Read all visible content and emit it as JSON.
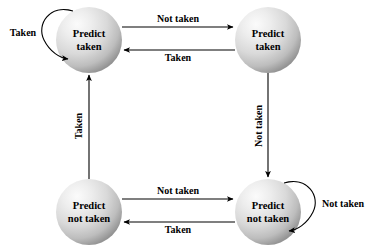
{
  "diagram": {
    "states": [
      {
        "id": "predict-taken-strong",
        "line1": "Predict",
        "line2": "taken",
        "cx": 89,
        "cy": 40,
        "r": 33
      },
      {
        "id": "predict-taken-weak",
        "line1": "Predict",
        "line2": "taken",
        "cx": 268,
        "cy": 40,
        "r": 33
      },
      {
        "id": "predict-not-taken-weak",
        "line1": "Predict",
        "line2": "not taken",
        "cx": 89,
        "cy": 212,
        "r": 33
      },
      {
        "id": "predict-not-taken-strong",
        "line1": "Predict",
        "line2": "not taken",
        "cx": 268,
        "cy": 212,
        "r": 33
      }
    ],
    "transitions": [
      {
        "id": "top-right-edge",
        "label": "Not taken",
        "from": "predict-taken-strong",
        "to": "predict-taken-weak",
        "label_x": 178,
        "label_y": 20
      },
      {
        "id": "top-left-edge",
        "label": "Taken",
        "from": "predict-taken-weak",
        "to": "predict-taken-strong",
        "label_x": 178,
        "label_y": 58
      },
      {
        "id": "bottom-right-edge",
        "label": "Not taken",
        "from": "predict-not-taken-weak",
        "to": "predict-not-taken-strong",
        "label_x": 178,
        "label_y": 192
      },
      {
        "id": "bottom-left-edge",
        "label": "Taken",
        "from": "predict-not-taken-strong",
        "to": "predict-not-taken-weak",
        "label_x": 178,
        "label_y": 230
      },
      {
        "id": "left-up-edge",
        "label": "Taken",
        "from": "predict-not-taken-weak",
        "to": "predict-taken-strong",
        "label_x": 80,
        "label_y": 126,
        "rotated": "true"
      },
      {
        "id": "right-down-edge",
        "label": "Not taken",
        "from": "predict-taken-weak",
        "to": "predict-not-taken-strong",
        "label_x": 260,
        "label_y": 126,
        "rotated": "true"
      }
    ],
    "self_loops": [
      {
        "id": "self-loop-top-left",
        "label": "Taken",
        "state": "predict-taken-strong",
        "label_x": 23,
        "label_y": 34
      },
      {
        "id": "self-loop-bottom-right",
        "label": "Not taken",
        "state": "predict-not-taken-strong",
        "label_x": 343,
        "label_y": 205
      }
    ],
    "colors": {
      "stroke": "#000000",
      "text": "#000000",
      "background": "#ffffff",
      "sphere_highlight": "#f2f2f2",
      "sphere_mid": "#d0d0d0",
      "sphere_edge": "#8f8f8f"
    }
  }
}
